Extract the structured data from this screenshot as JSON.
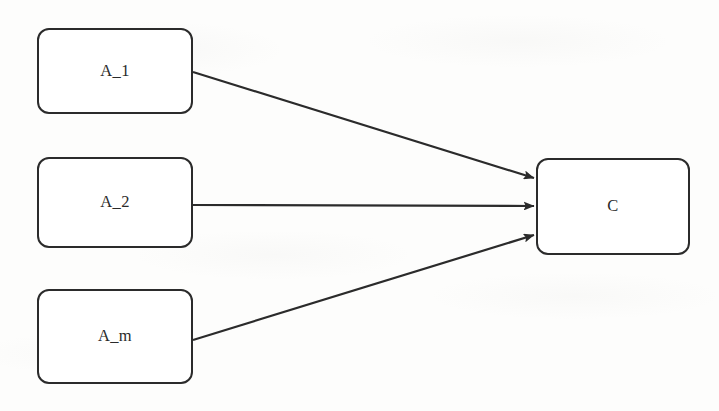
{
  "diagram": {
    "type": "convergent-flow-diagram",
    "canvas": {
      "width": 719,
      "height": 411,
      "background": "#fdfdfc"
    },
    "style": {
      "node_stroke": "#2b2b2b",
      "node_fill": "#ffffff",
      "edge_stroke": "#2b2b2b",
      "node_stroke_width": 2.2,
      "edge_stroke_width": 2.2,
      "corner_radius": 12
    },
    "nodes": [
      {
        "id": "A_1",
        "label": "A_1",
        "x": 37,
        "y": 28,
        "width": 156,
        "height": 86
      },
      {
        "id": "A_2",
        "label": "A_2",
        "x": 37,
        "y": 157,
        "width": 156,
        "height": 91
      },
      {
        "id": "A_m",
        "label": "A_m",
        "x": 37,
        "y": 289,
        "width": 156,
        "height": 95
      },
      {
        "id": "C",
        "label": "C",
        "x": 536,
        "y": 158,
        "width": 154,
        "height": 97
      }
    ],
    "edges": [
      {
        "id": "edge-a1-c",
        "from": "A_1",
        "to": "C",
        "x1": 193,
        "y1": 72,
        "x2": 534,
        "y2": 178,
        "arrowhead": true
      },
      {
        "id": "edge-a2-c",
        "from": "A_2",
        "to": "C",
        "x1": 193,
        "y1": 205,
        "x2": 534,
        "y2": 206,
        "arrowhead": true
      },
      {
        "id": "edge-am-c",
        "from": "A_m",
        "to": "C",
        "x1": 193,
        "y1": 340,
        "x2": 534,
        "y2": 235,
        "arrowhead": true
      }
    ]
  }
}
